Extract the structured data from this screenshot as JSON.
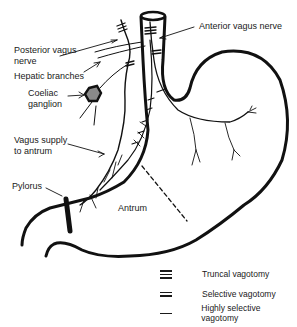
{
  "figure": {
    "labels": {
      "posterior_vagus": "Posterior vagus\nnerve",
      "anterior_vagus": "Anterior vagus nerve",
      "hepatic_branches": "Hepatic branches",
      "coeliac_ganglion": "Coeliac\nganglion",
      "vagus_supply": "Vagus supply\nto antrum",
      "pylorus": "Pylorus",
      "antrum": "Antrum"
    },
    "legend": [
      {
        "symbol": "triple-bar",
        "label": "Truncal vagotomy"
      },
      {
        "symbol": "double-bar",
        "label": "Selective vagotomy"
      },
      {
        "symbol": "single-bar",
        "label": "Highly selective vagotomy"
      }
    ],
    "colors": {
      "line": "#111111",
      "ganglion_fill": "#8a8a8a"
    }
  }
}
